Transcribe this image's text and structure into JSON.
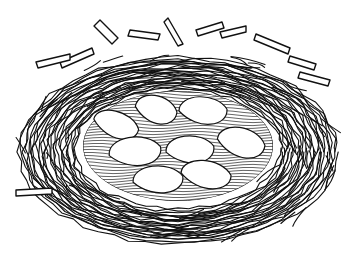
{
  "image": {
    "subject": "Bird's nest with eggs",
    "style": "black-and-white line drawing",
    "colors": {
      "line": "#111111",
      "background": "#ffffff",
      "egg_fill": "#ffffff"
    },
    "nest": {
      "outer": {
        "cx": 180,
        "cy": 148,
        "rx": 165,
        "ry": 100
      },
      "cavity": {
        "cx": 178,
        "cy": 146,
        "rx": 95,
        "ry": 55
      }
    },
    "egg_count": 8,
    "eggs": [
      {
        "name": "egg-left",
        "cx": 116,
        "cy": 125,
        "rx": 23,
        "ry": 16,
        "rot": 15
      },
      {
        "name": "egg-top-left",
        "cx": 156,
        "cy": 110,
        "rx": 21,
        "ry": 17,
        "rot": 10
      },
      {
        "name": "egg-top-right",
        "cx": 203,
        "cy": 111,
        "rx": 24,
        "ry": 17,
        "rot": 0
      },
      {
        "name": "egg-mid-left",
        "cx": 135,
        "cy": 152,
        "rx": 26,
        "ry": 18,
        "rot": -8
      },
      {
        "name": "egg-center",
        "cx": 190,
        "cy": 150,
        "rx": 24,
        "ry": 17,
        "rot": -5
      },
      {
        "name": "egg-right",
        "cx": 241,
        "cy": 143,
        "rx": 24,
        "ry": 18,
        "rot": 10
      },
      {
        "name": "egg-bottom-left",
        "cx": 158,
        "cy": 180,
        "rx": 25,
        "ry": 17,
        "rot": -5
      },
      {
        "name": "egg-bottom-right",
        "cx": 206,
        "cy": 175,
        "rx": 25,
        "ry": 17,
        "rot": 5
      }
    ]
  }
}
